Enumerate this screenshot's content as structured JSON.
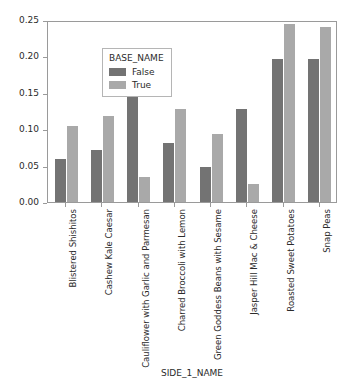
{
  "chart_data": {
    "type": "bar",
    "title": "",
    "xlabel": "SIDE_1_NAME",
    "ylabel": "",
    "ylim": [
      0.0,
      0.25
    ],
    "yticks": [
      "0.00",
      "0.05",
      "0.10",
      "0.15",
      "0.20",
      "0.25"
    ],
    "ytick_values": [
      0.0,
      0.05,
      0.1,
      0.15,
      0.2,
      0.25
    ],
    "grid": false,
    "legend_position": "upper left",
    "legend_title": "BASE_NAME",
    "categories": [
      "Blistered Shishitos",
      "Cashew Kale Caesar",
      "Cauliflower with Garlic and Parmesan",
      "Charred Broccoli with Lemon",
      "Green Goddess Beans with Sesame",
      "Jasper Hill Mac & Cheese",
      "Roasted Sweet Potatoes",
      "Snap Peas"
    ],
    "series": [
      {
        "name": "False",
        "color": "#737373",
        "values": [
          0.059,
          0.071,
          0.207,
          0.081,
          0.048,
          0.128,
          0.197,
          0.196
        ]
      },
      {
        "name": "True",
        "color": "#a9a9a9",
        "values": [
          0.105,
          0.118,
          0.034,
          0.128,
          0.094,
          0.025,
          0.244,
          0.24
        ]
      }
    ]
  }
}
